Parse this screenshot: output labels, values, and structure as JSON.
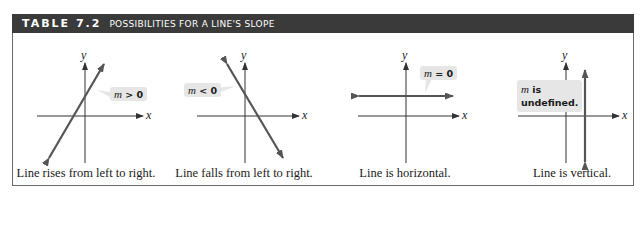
{
  "header": {
    "table_number": "TABLE 7.2",
    "title": "POSSIBILITIES FOR A LINE'S SLOPE"
  },
  "colors": {
    "header_bg": "#3a3a3a",
    "line": "#555555",
    "axis": "#333333",
    "callout_bg": "#e6e6e6"
  },
  "panels": [
    {
      "callout_m": "m",
      "callout_rest": " > 0",
      "caption": "Line rises from left to right.",
      "x_label": "x",
      "y_label": "y"
    },
    {
      "callout_m": "m",
      "callout_rest": " < 0",
      "caption": "Line falls from left to right.",
      "x_label": "x",
      "y_label": "y"
    },
    {
      "callout_m": "m",
      "callout_rest": " = 0",
      "caption": "Line is horizontal.",
      "x_label": "x",
      "y_label": "y"
    },
    {
      "callout_m": "m",
      "callout_rest": " is",
      "callout_rest2": "undefined.",
      "caption": "Line is vertical.",
      "x_label": "x",
      "y_label": "y"
    }
  ]
}
